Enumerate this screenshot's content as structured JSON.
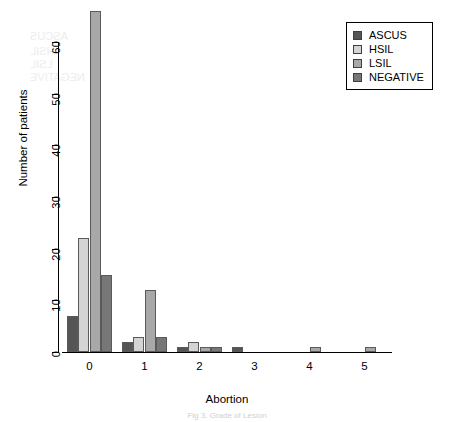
{
  "chart_data": {
    "type": "bar",
    "title": "",
    "xlabel": "Abortion",
    "ylabel": "Number of patients",
    "categories": [
      "0",
      "1",
      "2",
      "3",
      "4",
      "5"
    ],
    "series": [
      {
        "name": "ASCUS",
        "color": "#555555",
        "values": [
          7,
          2,
          1,
          1,
          0,
          0
        ]
      },
      {
        "name": "HSIL",
        "color": "#d4d4d4",
        "values": [
          22,
          3,
          2,
          0,
          0,
          0
        ]
      },
      {
        "name": "LSIL",
        "color": "#a8a8a8",
        "values": [
          66,
          12,
          1,
          0,
          1,
          1
        ]
      },
      {
        "name": "NEGATIVE",
        "color": "#777777",
        "values": [
          15,
          3,
          1,
          0,
          0,
          0
        ]
      }
    ],
    "ylim": [
      0,
      66
    ],
    "yticks": [
      0,
      10,
      20,
      30,
      40,
      50,
      60
    ],
    "ytick_labels": [
      "0",
      "10",
      "20",
      "30",
      "40",
      "50",
      "60"
    ],
    "grid": false,
    "legend_position": "top-right"
  },
  "legend": {
    "entries": [
      {
        "label": "ASCUS"
      },
      {
        "label": "HSIL"
      },
      {
        "label": "LSIL"
      },
      {
        "label": "NEGATIVE"
      }
    ]
  },
  "caption": {
    "text": "Fig 3. Grade of Lesion"
  }
}
